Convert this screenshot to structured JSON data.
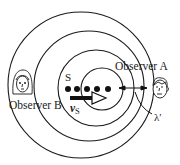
{
  "diagram": {
    "labels": {
      "observer_a": "Observer A",
      "observer_b": "Observer B",
      "source": "S",
      "velocity_symbol": "v",
      "velocity_subscript": "S",
      "wavelength": "λ′"
    },
    "wavefronts": [
      {
        "cx": 81,
        "cy": 85,
        "r": 73
      },
      {
        "cx": 89,
        "cy": 86,
        "r": 55
      },
      {
        "cx": 96,
        "cy": 88,
        "r": 38
      },
      {
        "cx": 102,
        "cy": 89,
        "r": 21
      }
    ],
    "source_positions": [
      {
        "x": 68,
        "y": 89
      },
      {
        "x": 77,
        "y": 89
      },
      {
        "x": 87,
        "y": 89
      },
      {
        "x": 97,
        "y": 89
      },
      {
        "x": 108,
        "y": 89
      }
    ],
    "velocity_arrow": {
      "x1": 70,
      "x2": 106,
      "y": 98
    },
    "wavelength_marker": {
      "x1": 119,
      "x2": 147,
      "y": 88
    },
    "colors": {
      "ink": "#1a1a1a",
      "background": "#ffffff"
    }
  }
}
